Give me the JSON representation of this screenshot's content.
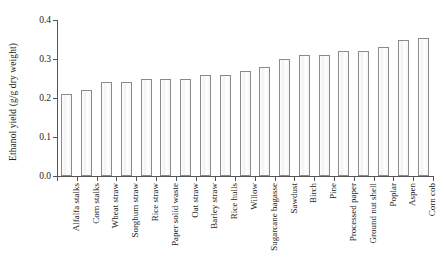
{
  "chart_data": {
    "type": "bar",
    "title": "",
    "xlabel": "",
    "ylabel": "Ethanol yield (g/g dry weight)",
    "ylim": [
      0.0,
      0.4
    ],
    "yticks": [
      "0.0",
      "0.1",
      "0.2",
      "0.3",
      "0.4"
    ],
    "ytick_values": [
      0.0,
      0.1,
      0.2,
      0.3,
      0.4
    ],
    "grid": false,
    "legend": null,
    "categories": [
      "Alfalfa stalks",
      "Corn stalks",
      "Wheat straw",
      "Sorghum straw",
      "Rice straw",
      "Paper solid waste",
      "Oat straw",
      "Barley straw",
      "Rice hulls",
      "Willow",
      "Sugarcane bagasse",
      "Sawdust",
      "Birch",
      "Pine",
      "Processed paper",
      "Ground nut shell",
      "Poplar",
      "Aspen",
      "Corn cob"
    ],
    "values": [
      0.21,
      0.22,
      0.24,
      0.24,
      0.25,
      0.25,
      0.25,
      0.26,
      0.26,
      0.27,
      0.28,
      0.3,
      0.31,
      0.31,
      0.32,
      0.32,
      0.33,
      0.35,
      0.355
    ]
  },
  "style": {
    "axis_color": "#555555",
    "bar_edge_color": "#8a8a8a",
    "bar_fill_color": "#fbfbfb",
    "text_color": "#222222",
    "background": "#ffffff"
  }
}
